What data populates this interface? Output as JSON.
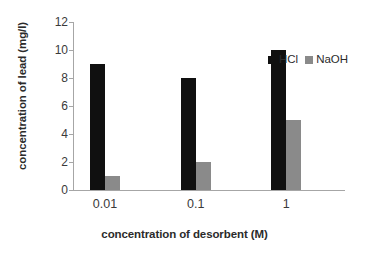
{
  "chart_data": {
    "type": "bar",
    "title": "",
    "subtitle": "",
    "xlabel": "concentration of desorbent (M)",
    "ylabel": "concentration of lead  (mg/l)",
    "categories": [
      "0.01",
      "0.1",
      "1"
    ],
    "series": [
      {
        "name": "HCl",
        "color": "#101010",
        "values": [
          9,
          8,
          10
        ]
      },
      {
        "name": "NaOH",
        "color": "#8a8a8a",
        "values": [
          1,
          2,
          5
        ]
      }
    ],
    "ylim": [
      0,
      12
    ],
    "ytick_step": 2,
    "yticks": [
      "12",
      "10",
      "8",
      "6",
      "4",
      "2",
      "0"
    ],
    "grid": false,
    "legend_position": "top-right",
    "axis_color": "#a6a6a6",
    "background": "#ffffff"
  },
  "legend": {
    "items": [
      {
        "label": "HCl",
        "swatch": "black-square-icon"
      },
      {
        "label": "NaOH",
        "swatch": "gray-square-icon"
      }
    ]
  }
}
